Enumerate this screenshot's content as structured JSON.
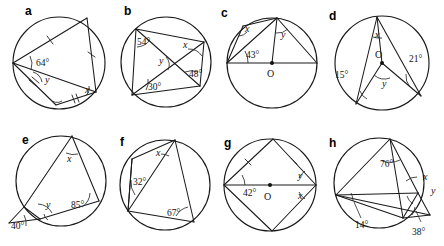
{
  "figure": {
    "type": "geometry-diagram-set",
    "panel_count": 8,
    "stroke_color": "#1a1a1a",
    "background_color": "#ffffff"
  },
  "panels": [
    {
      "id": "a",
      "letter": "a",
      "description": "Cyclic quadrilateral with two pairs of equal chords marked by tick marks",
      "angles": [
        {
          "name": "angle-64",
          "label": "64°"
        },
        {
          "name": "angle-y",
          "label": "y"
        },
        {
          "name": "angle-x",
          "label": "x"
        }
      ],
      "marks": [
        "single-tick",
        "single-tick",
        "double-tick",
        "double-tick"
      ]
    },
    {
      "id": "b",
      "letter": "b",
      "description": "Cyclic quadrilateral with both diagonals drawn",
      "angles": [
        {
          "name": "angle-54",
          "label": "54°"
        },
        {
          "name": "angle-x",
          "label": "x"
        },
        {
          "name": "angle-y",
          "label": "y"
        },
        {
          "name": "angle-48",
          "label": "48°"
        },
        {
          "name": "angle-30",
          "label": "30°"
        }
      ],
      "marks": []
    },
    {
      "id": "c",
      "letter": "c",
      "description": "Circle with centre O and horizontal diameter, chords from top point",
      "centre_label": "O",
      "angles": [
        {
          "name": "angle-x",
          "label": "x"
        },
        {
          "name": "angle-y",
          "label": "y"
        },
        {
          "name": "angle-43",
          "label": "43°"
        }
      ],
      "marks": []
    },
    {
      "id": "d",
      "letter": "d",
      "description": "Circle with centre O, two radii and chords forming angles at circumference",
      "centre_label": "O",
      "angles": [
        {
          "name": "angle-x",
          "label": "x"
        },
        {
          "name": "angle-21",
          "label": "21°"
        },
        {
          "name": "angle-15",
          "label": "15°"
        },
        {
          "name": "angle-y",
          "label": "y"
        }
      ],
      "marks": []
    },
    {
      "id": "e",
      "letter": "e",
      "description": "Circle with a vertex outside the circle at lower left, 40 degree external angle",
      "angles": [
        {
          "name": "angle-x",
          "label": "x"
        },
        {
          "name": "angle-y",
          "label": "y"
        },
        {
          "name": "angle-85",
          "label": "85°"
        },
        {
          "name": "angle-40",
          "label": "40°"
        }
      ],
      "marks": []
    },
    {
      "id": "f",
      "letter": "f",
      "description": "Cyclic quadrilateral with a diagonal drawn from the top vertex",
      "angles": [
        {
          "name": "angle-x",
          "label": "x"
        },
        {
          "name": "angle-32",
          "label": "32°"
        },
        {
          "name": "angle-67",
          "label": "67°"
        }
      ],
      "marks": []
    },
    {
      "id": "g",
      "letter": "g",
      "description": "Kite inscribed in a circle with centre O on the horizontal diagonal, equal upper sides marked",
      "centre_label": "O",
      "angles": [
        {
          "name": "angle-42",
          "label": "42°"
        },
        {
          "name": "angle-y",
          "label": "y"
        },
        {
          "name": "angle-x",
          "label": "x"
        }
      ],
      "marks": [
        "single-tick",
        "single-tick"
      ]
    },
    {
      "id": "h",
      "letter": "h",
      "description": "Circle with chords meeting at an external point on the right, angles 76, 14 and 38 degrees",
      "angles": [
        {
          "name": "angle-76",
          "label": "76°"
        },
        {
          "name": "angle-x",
          "label": "x"
        },
        {
          "name": "angle-y",
          "label": "y"
        },
        {
          "name": "angle-14",
          "label": "14°"
        },
        {
          "name": "angle-38",
          "label": "38°"
        }
      ],
      "marks": []
    }
  ]
}
